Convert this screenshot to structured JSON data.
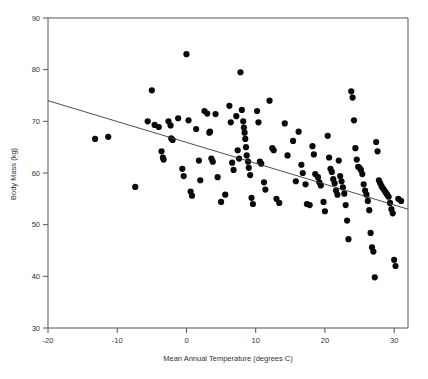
{
  "chart_data": {
    "type": "scatter",
    "title": "",
    "xlabel": "Mean Annual Temperature (degrees C)",
    "ylabel": "Body Mass (kg)",
    "xlim": [
      -20,
      32
    ],
    "ylim": [
      30,
      90
    ],
    "xticks": [
      -20,
      -10,
      0,
      10,
      20,
      30
    ],
    "xtick_labels": [
      "-20",
      "-10",
      "0",
      "10",
      "20",
      "30"
    ],
    "yticks": [
      30,
      40,
      50,
      60,
      70,
      80,
      90
    ],
    "ytick_labels": [
      "30",
      "40",
      "50",
      "60",
      "70",
      "80",
      "90"
    ],
    "grid": false,
    "legend": "none",
    "marker_color": "#0a0a0a",
    "marker_size": 3.1,
    "trend_line": {
      "name": "linear regression",
      "color": "#3a3a3a",
      "x_start": -20,
      "y_start": 74.0,
      "x_end": 32,
      "y_end": 53.0
    },
    "points": [
      [
        -13.2,
        66.6
      ],
      [
        -11.3,
        67.0
      ],
      [
        -7.4,
        57.3
      ],
      [
        -5.6,
        70.0
      ],
      [
        -5.0,
        76.0
      ],
      [
        -4.6,
        69.3
      ],
      [
        -4.0,
        68.9
      ],
      [
        -3.6,
        64.2
      ],
      [
        -3.4,
        63.0
      ],
      [
        -3.3,
        62.6
      ],
      [
        -2.6,
        70.0
      ],
      [
        -2.3,
        69.2
      ],
      [
        -2.2,
        66.7
      ],
      [
        -2.0,
        66.4
      ],
      [
        -1.2,
        70.6
      ],
      [
        -0.6,
        60.8
      ],
      [
        -0.4,
        59.4
      ],
      [
        0.0,
        83.0
      ],
      [
        0.3,
        70.2
      ],
      [
        0.6,
        56.4
      ],
      [
        0.8,
        55.6
      ],
      [
        1.4,
        68.5
      ],
      [
        1.8,
        62.4
      ],
      [
        2.0,
        58.6
      ],
      [
        2.6,
        72.0
      ],
      [
        3.0,
        71.5
      ],
      [
        3.3,
        67.8
      ],
      [
        3.4,
        68.0
      ],
      [
        3.6,
        62.8
      ],
      [
        3.8,
        62.2
      ],
      [
        4.2,
        71.4
      ],
      [
        4.5,
        59.2
      ],
      [
        5.0,
        54.4
      ],
      [
        5.6,
        55.8
      ],
      [
        6.2,
        73.0
      ],
      [
        6.4,
        69.8
      ],
      [
        6.6,
        62.0
      ],
      [
        6.8,
        60.6
      ],
      [
        7.2,
        71.0
      ],
      [
        7.4,
        64.4
      ],
      [
        7.6,
        62.8
      ],
      [
        7.8,
        79.5
      ],
      [
        8.0,
        72.2
      ],
      [
        8.2,
        70.0
      ],
      [
        8.3,
        68.8
      ],
      [
        8.4,
        67.8
      ],
      [
        8.5,
        66.6
      ],
      [
        8.6,
        65.0
      ],
      [
        8.7,
        63.4
      ],
      [
        8.9,
        62.2
      ],
      [
        9.0,
        61.0
      ],
      [
        9.2,
        59.6
      ],
      [
        9.4,
        55.2
      ],
      [
        9.6,
        54.0
      ],
      [
        10.2,
        72.0
      ],
      [
        10.4,
        69.8
      ],
      [
        10.6,
        62.2
      ],
      [
        10.8,
        61.8
      ],
      [
        11.2,
        58.2
      ],
      [
        11.4,
        56.8
      ],
      [
        12.0,
        74.0
      ],
      [
        12.4,
        64.8
      ],
      [
        12.6,
        64.4
      ],
      [
        13.0,
        55.0
      ],
      [
        13.4,
        54.2
      ],
      [
        14.2,
        69.6
      ],
      [
        14.6,
        63.4
      ],
      [
        15.4,
        66.2
      ],
      [
        15.8,
        58.4
      ],
      [
        16.2,
        68.0
      ],
      [
        16.6,
        61.6
      ],
      [
        16.8,
        60.0
      ],
      [
        17.2,
        57.8
      ],
      [
        17.4,
        54.0
      ],
      [
        17.8,
        53.8
      ],
      [
        18.2,
        65.2
      ],
      [
        18.4,
        63.6
      ],
      [
        18.6,
        59.8
      ],
      [
        19.0,
        59.2
      ],
      [
        19.2,
        58.2
      ],
      [
        19.4,
        57.6
      ],
      [
        19.8,
        54.4
      ],
      [
        20.0,
        52.6
      ],
      [
        20.4,
        67.2
      ],
      [
        20.6,
        63.0
      ],
      [
        20.8,
        60.8
      ],
      [
        21.0,
        60.2
      ],
      [
        21.2,
        58.8
      ],
      [
        21.4,
        58.0
      ],
      [
        21.6,
        56.6
      ],
      [
        21.8,
        55.8
      ],
      [
        22.0,
        62.4
      ],
      [
        22.2,
        59.4
      ],
      [
        22.4,
        58.4
      ],
      [
        22.6,
        57.2
      ],
      [
        22.8,
        56.0
      ],
      [
        23.0,
        53.8
      ],
      [
        23.2,
        50.8
      ],
      [
        23.4,
        47.2
      ],
      [
        23.8,
        75.8
      ],
      [
        24.0,
        74.6
      ],
      [
        24.2,
        70.2
      ],
      [
        24.4,
        64.8
      ],
      [
        24.6,
        62.6
      ],
      [
        24.8,
        61.2
      ],
      [
        25.0,
        61.0
      ],
      [
        25.2,
        60.6
      ],
      [
        25.4,
        59.8
      ],
      [
        25.6,
        57.8
      ],
      [
        25.8,
        56.6
      ],
      [
        26.0,
        55.8
      ],
      [
        26.2,
        54.6
      ],
      [
        26.4,
        52.8
      ],
      [
        26.6,
        48.4
      ],
      [
        26.8,
        45.6
      ],
      [
        27.0,
        44.8
      ],
      [
        27.2,
        39.8
      ],
      [
        27.4,
        66.0
      ],
      [
        27.6,
        64.2
      ],
      [
        27.8,
        58.6
      ],
      [
        28.0,
        58.0
      ],
      [
        28.2,
        57.4
      ],
      [
        28.4,
        57.0
      ],
      [
        28.6,
        56.6
      ],
      [
        28.8,
        56.2
      ],
      [
        29.0,
        55.8
      ],
      [
        29.2,
        55.4
      ],
      [
        29.4,
        54.2
      ],
      [
        29.6,
        53.0
      ],
      [
        29.8,
        52.2
      ],
      [
        30.0,
        43.2
      ],
      [
        30.2,
        42.0
      ],
      [
        30.6,
        55.0
      ],
      [
        31.0,
        54.6
      ]
    ]
  }
}
